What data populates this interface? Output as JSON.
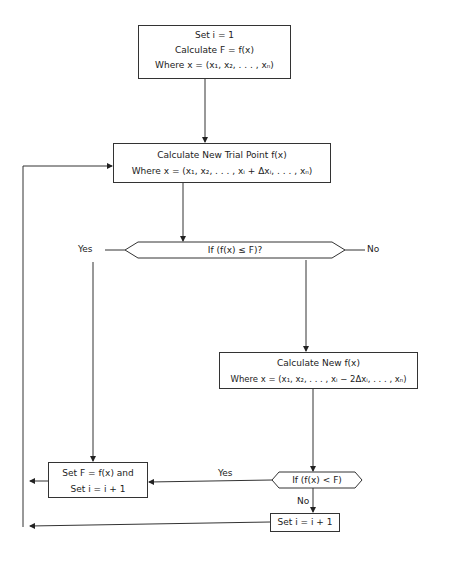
{
  "start_box": {
    "line1": "Set i = 1",
    "line2": "Calculate  F = f(x)",
    "line3": "Where  x = (x₁, x₂, . . . , xₙ)"
  },
  "trial_box": {
    "line1": "Calculate New Trial Point f(x)",
    "line2": "Where  x = (x₁, x₂, . . . , xᵢ + Δxᵢ, . . . , xₙ)"
  },
  "decision1": {
    "text": "If (f(x) ≤ F)?",
    "yes_label": "Yes",
    "no_label": "No"
  },
  "new_f_box": {
    "line1": "Calculate New f(x)",
    "line2": "Where  x = (x₁, x₂, . . . , xᵢ − 2Δxᵢ, . . . , xₙ)"
  },
  "decision2": {
    "text": "If (f(x) < F)",
    "yes_label": "Yes",
    "no_label": "No"
  },
  "update_box": {
    "line1": "Set F = f(x)  and",
    "line2": "Set i = i + 1"
  },
  "increment_box": {
    "line1": "Set i = i + 1"
  }
}
